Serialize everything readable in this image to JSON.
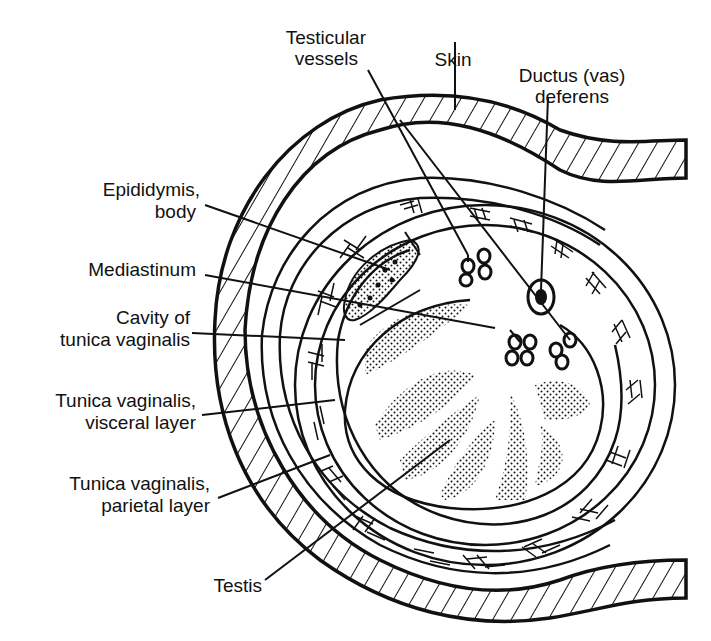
{
  "colors": {
    "ink": "#111111",
    "background": "#ffffff"
  },
  "labels": {
    "testicular_vessels": {
      "line1": "Testicular",
      "line2": "vessels"
    },
    "skin": {
      "line1": "Skin"
    },
    "ductus_deferens": {
      "line1": "Ductus (vas)",
      "line2": "deferens"
    },
    "epididymis_body": {
      "line1": "Epididymis,",
      "line2": "body"
    },
    "mediastinum": {
      "line1": "Mediastinum"
    },
    "cavity": {
      "line1": "Cavity of",
      "line2": "tunica vaginalis"
    },
    "visceral": {
      "line1": "Tunica vaginalis,",
      "line2": "visceral layer"
    },
    "parietal": {
      "line1": "Tunica vaginalis,",
      "line2": "parietal layer"
    },
    "testis": {
      "line1": "Testis"
    }
  }
}
